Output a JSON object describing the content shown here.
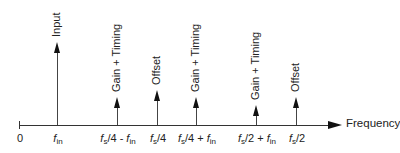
{
  "diagram": {
    "axis_label": "Frequency",
    "origin_label": "0",
    "components": [
      {
        "x": 57,
        "top": 42,
        "label": "Input",
        "tick": {
          "pre": "",
          "f": "f",
          "sub": "in",
          "post": "",
          "f2": "",
          "sub2": ""
        }
      },
      {
        "x": 117,
        "top": 97,
        "label": "Gain + Timing",
        "tick": {
          "pre": "",
          "f": "f",
          "sub": "s",
          "post": "/4 - ",
          "f2": "f",
          "sub2": "in"
        }
      },
      {
        "x": 157,
        "top": 90,
        "label": "Offset",
        "tick": {
          "pre": "",
          "f": "f",
          "sub": "s",
          "post": "/4",
          "f2": "",
          "sub2": ""
        }
      },
      {
        "x": 196,
        "top": 97,
        "label": "Gain + Timing",
        "tick": {
          "pre": "",
          "f": "f",
          "sub": "s",
          "post": "/4 + ",
          "f2": "f",
          "sub2": "in"
        }
      },
      {
        "x": 256,
        "top": 105,
        "label": "Gain + Timing",
        "tick": {
          "pre": "",
          "f": "f",
          "sub": "s",
          "post": "/2 + ",
          "f2": "f",
          "sub2": "in"
        }
      },
      {
        "x": 296,
        "top": 97,
        "label": "Offset",
        "tick": {
          "pre": "",
          "f": "f",
          "sub": "s",
          "post": "/2",
          "f2": "",
          "sub2": ""
        }
      }
    ]
  }
}
